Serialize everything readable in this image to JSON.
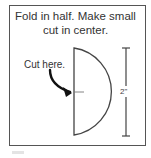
{
  "instructions": {
    "line1": "Fold in half. Make small",
    "line2": "cut in center."
  },
  "callout": {
    "label": "Cut here."
  },
  "dimension": {
    "label": "2\""
  },
  "colors": {
    "stroke": "#444444",
    "text": "#333333",
    "background": "#ffffff"
  }
}
